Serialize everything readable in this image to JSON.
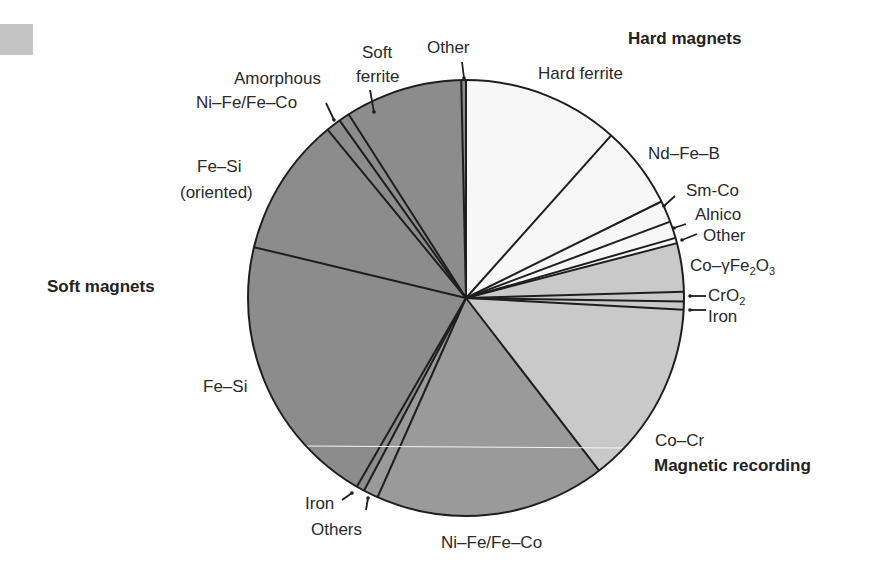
{
  "chart_data": {
    "type": "pie",
    "title": "",
    "unit": "share of magnetic materials market (%), estimated from slice angles",
    "start_angle_deg": 0,
    "direction": "clockwise",
    "groups": [
      {
        "name": "Hard magnets",
        "color": "#f7f7f7"
      },
      {
        "name": "Magnetic recording",
        "color": "#c9c9c9"
      },
      {
        "name": "Soft magnets",
        "color": "#8c8c8c"
      }
    ],
    "slices": [
      {
        "label": "Hard ferrite",
        "group": "Hard magnets",
        "value": 11.6,
        "color": "#f7f7f7"
      },
      {
        "label": "Nd–Fe–B",
        "group": "Hard magnets",
        "value": 6.1,
        "color": "#f7f7f7"
      },
      {
        "label": "Sm-Co",
        "group": "Hard magnets",
        "value": 1.6,
        "color": "#f7f7f7"
      },
      {
        "label": "Alnico",
        "group": "Hard magnets",
        "value": 1.25,
        "color": "#f7f7f7"
      },
      {
        "label": "Other",
        "group": "Hard magnets",
        "value": 0.4,
        "color": "#f7f7f7"
      },
      {
        "label": "Co–γFe2O3",
        "group": "Magnetic recording",
        "value": 3.6,
        "color": "#c9c9c9"
      },
      {
        "label": "CrO2",
        "group": "Magnetic recording",
        "value": 0.7,
        "color": "#c9c9c9"
      },
      {
        "label": "Iron",
        "group": "Magnetic recording",
        "value": 0.6,
        "color": "#c9c9c9"
      },
      {
        "label": "Co–Cr",
        "group": "Magnetic recording",
        "value": 13.7,
        "color": "#c9c9c9"
      },
      {
        "label": "Ni–Fe/Fe–Co",
        "group": "Soft magnets",
        "value": 17.1,
        "color": "#9a9a9a"
      },
      {
        "label": "Others",
        "group": "Soft magnets",
        "value": 1.1,
        "color": "#9a9a9a"
      },
      {
        "label": "Iron",
        "group": "Soft magnets",
        "value": 0.6,
        "color": "#8c8c8c"
      },
      {
        "label": "Fe–Si",
        "group": "Soft magnets",
        "value": 20.4,
        "color": "#8c8c8c"
      },
      {
        "label": "Fe–Si (oriented)",
        "group": "Soft magnets",
        "value": 10.3,
        "color": "#8c8c8c"
      },
      {
        "label": "Ni–Fe/Fe–Co",
        "group": "Soft magnets",
        "value": 1.1,
        "color": "#8c8c8c"
      },
      {
        "label": "Amorphous",
        "group": "Soft magnets",
        "value": 0.8,
        "color": "#8c8c8c"
      },
      {
        "label": "Soft ferrite",
        "group": "Soft magnets",
        "value": 8.7,
        "color": "#8c8c8c"
      },
      {
        "label": "Other",
        "group": "Soft magnets",
        "value": 0.35,
        "color": "#8c8c8c"
      }
    ],
    "legend": "none (group labels placed beside chart)"
  },
  "labels": {
    "hard_magnets": "Hard magnets",
    "magnetic_recording": "Magnetic recording",
    "soft_magnets": "Soft magnets",
    "hard_ferrite": "Hard ferrite",
    "nd_fe_b": "Nd–Fe–B",
    "sm_co": "Sm-Co",
    "alnico": "Alnico",
    "other_hard": "Other",
    "co_gamma_pre": "Co–γFe",
    "co_gamma_sub1": "2",
    "co_gamma_mid": "O",
    "co_gamma_sub2": "3",
    "cro2_pre": "CrO",
    "cro2_sub": "2",
    "iron_rec": "Iron",
    "co_cr": "Co–Cr",
    "ni_fe_bottom": "Ni–Fe/Fe–Co",
    "others_soft": "Others",
    "iron_soft": "Iron",
    "fe_si": "Fe–Si",
    "fe_si_oriented_1": "Fe–Si",
    "fe_si_oriented_2": "(oriented)",
    "ni_fe_top": "Ni–Fe/Fe–Co",
    "amorphous": "Amorphous",
    "soft_ferrite_1": "Soft",
    "soft_ferrite_2": "ferrite",
    "other_soft_top": "Other"
  }
}
